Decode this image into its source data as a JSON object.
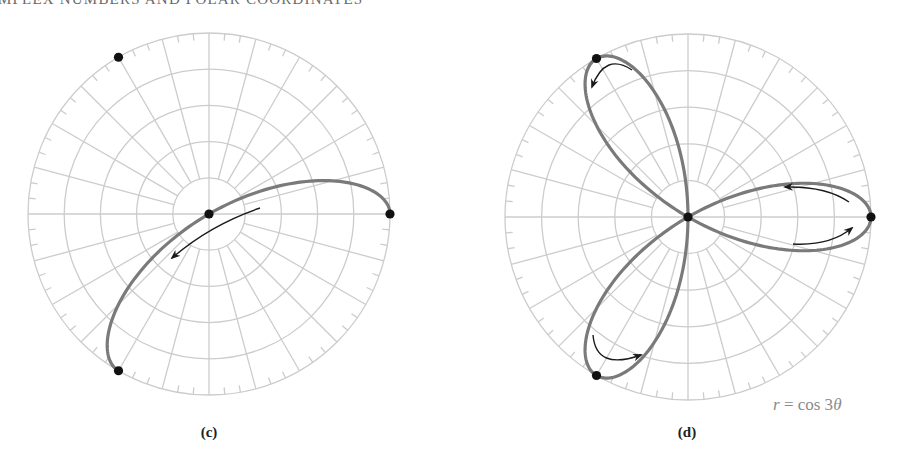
{
  "page": {
    "running_head": "MPLEX NUMBERS AND POLAR COORDINATES"
  },
  "style": {
    "grid_color": "#cccccc",
    "curve_color": "#7a7a7a",
    "arrow_color": "#1a1a1a",
    "dot_color": "#111111",
    "equation_color": "#8a8a8a"
  },
  "grid": {
    "rings": 5,
    "spokes_every_deg": 15,
    "ticks_every_deg": 5
  },
  "figures": [
    {
      "id": "c",
      "label": "(c)",
      "center": [
        209,
        214
      ],
      "radius": 181,
      "curve": {
        "equation": "r = cos 3θ",
        "theta_start_deg": 0,
        "theta_end_deg": 60
      },
      "dots": [
        {
          "r": 0,
          "deg": 0
        },
        {
          "r": 1,
          "deg": 0
        },
        {
          "r": 1,
          "deg": 120
        },
        {
          "r": 1,
          "deg": 240
        }
      ],
      "arrows": [
        {
          "path": "M 260 208 Q 210 225 172 258",
          "head_at": [
            172,
            258
          ]
        }
      ],
      "label_pos": [
        209,
        424
      ]
    },
    {
      "id": "d",
      "label": "(d)",
      "center": [
        688,
        217
      ],
      "radius": 183,
      "curve": {
        "equation": "r = cos 3θ",
        "theta_start_deg": 0,
        "theta_end_deg": 180
      },
      "dots": [
        {
          "r": 0,
          "deg": 0
        },
        {
          "r": 1,
          "deg": 0
        },
        {
          "r": 1,
          "deg": 120
        },
        {
          "r": 1,
          "deg": 240
        }
      ],
      "arrows": [
        {
          "path": "M 849 202 Q 826 186 785 187",
          "head_at": [
            785,
            187
          ]
        },
        {
          "path": "M 793 244 Q 830 246 852 228",
          "head_at": [
            852,
            228
          ]
        },
        {
          "path": "M 632 70 Q 605 52 592 87",
          "head_at": [
            592,
            87
          ]
        },
        {
          "path": "M 593 335 Q 596 371 641 355",
          "head_at": [
            641,
            355
          ]
        }
      ],
      "label_pos": [
        687,
        424
      ],
      "equation": {
        "prefix": "r",
        "text": " = cos 3",
        "var": "θ",
        "pos": [
          773,
          395
        ]
      }
    }
  ]
}
